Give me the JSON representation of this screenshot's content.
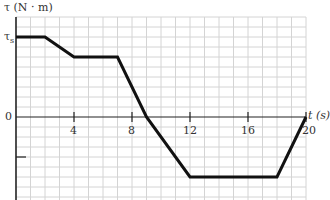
{
  "chart_data": {
    "type": "line",
    "title": "",
    "xlabel": "t (s)",
    "ylabel": "τ (N · m)",
    "x_ticks": [
      4,
      8,
      12,
      16,
      20
    ],
    "x_tick_labels": [
      "4",
      "8",
      "12",
      "16",
      "20"
    ],
    "y_tick_labels": [
      "τs",
      "0"
    ],
    "xlim": [
      0,
      20
    ],
    "grid": true,
    "series": [
      {
        "name": "torque",
        "x": [
          0,
          2,
          4,
          7,
          9,
          12,
          18,
          20
        ],
        "y_grid_units": [
          8,
          8,
          6,
          6,
          0,
          -6,
          -6,
          0
        ],
        "y_description": [
          "τs",
          "τs",
          "0.75τs",
          "0.75τs",
          "0",
          "-0.75τs",
          "-0.75τs",
          "0"
        ]
      }
    ],
    "annotations": {
      "y_axis_label": "τ (N · m)",
      "x_axis_label": "t (s)",
      "ts_label": "τ",
      "ts_subscript": "s",
      "zero_label": "0"
    }
  },
  "colors": {
    "grid": "#d4d4d4",
    "axis": "#222222",
    "curve": "#111111",
    "text": "#333333"
  }
}
